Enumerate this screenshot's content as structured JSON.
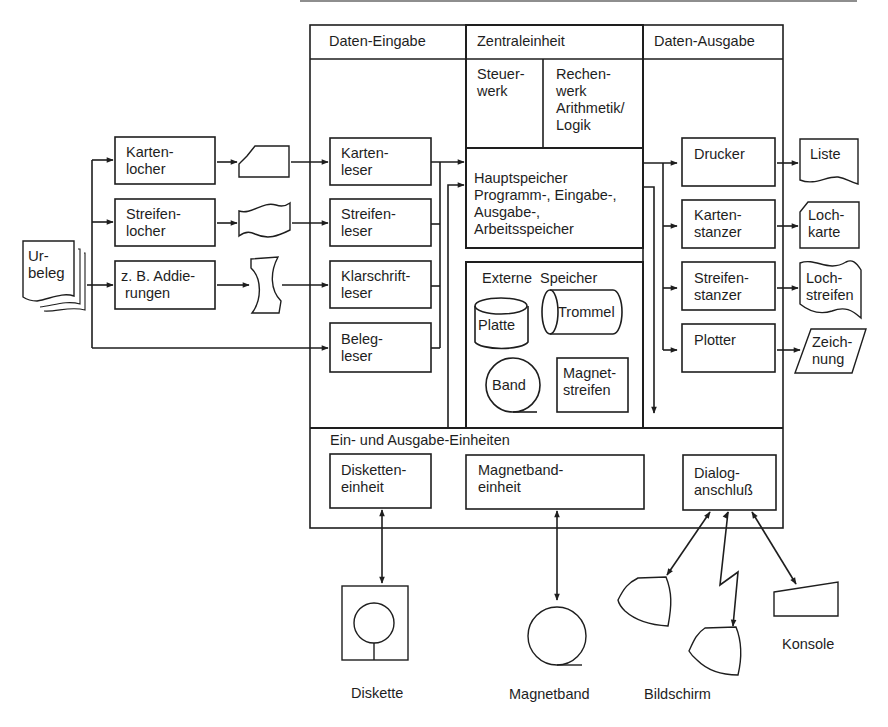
{
  "sections": {
    "input": "Daten-Eingabe",
    "cpu": "Zentraleinheit",
    "output": "Daten-Ausgabe",
    "io_units": "Ein- und Ausgabe-Einheiten"
  },
  "source": {
    "label": "Ur-\nbeleg"
  },
  "preparation": [
    {
      "label": "Karten-\nlocher",
      "medium": "punched-card"
    },
    {
      "label": "Streifen-\nlocher",
      "medium": "punched-tape"
    },
    {
      "label": "z. B. Addie-\n rungen",
      "medium": "paper-strip"
    }
  ],
  "input_devices": [
    {
      "label": "Karten-\nleser"
    },
    {
      "label": "Streifen-\nleser"
    },
    {
      "label": "Klarschrift-\nleser"
    },
    {
      "label": "Beleg-\nleser"
    }
  ],
  "cpu": {
    "control_unit": "Steuer-\nwerk",
    "alu": "Rechen-\nwerk\nArithmetik/\nLogik",
    "main_memory": "Hauptspeicher\nProgramm-, Eingabe-,\nAusgabe-,\nArbeitsspeicher"
  },
  "external_storage": {
    "title": "Externe  Speicher",
    "items": [
      "Platte",
      "Trommel",
      "Band",
      "Magnet-\nstreifen"
    ]
  },
  "output_devices": [
    {
      "label": "Drucker",
      "product": "Liste"
    },
    {
      "label": "Karten-\nstanzer",
      "product": "Loch-\nkarte"
    },
    {
      "label": "Streifen-\nstanzer",
      "product": "Loch-\nstreifen"
    },
    {
      "label": "Plotter",
      "product": "Zeich-\nnung"
    }
  ],
  "io_units": [
    {
      "label": "Disketten-\neinheit",
      "peripheral": "Diskette"
    },
    {
      "label": "Magnetband-\neinheit",
      "peripheral": "Magnetband"
    },
    {
      "label": "Dialog-\nanschluß",
      "peripheral": "Bildschirm"
    }
  ],
  "peripherals": {
    "diskette": "Diskette",
    "magnetband": "Magnetband",
    "bildschirm": "Bildschirm",
    "konsole": "Konsole"
  },
  "colors": {
    "ink": "#1e1e1e",
    "paper": "#ffffff"
  }
}
